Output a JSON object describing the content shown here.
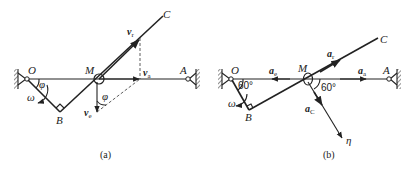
{
  "figure": {
    "panel_a": {
      "caption": "(a)",
      "points": {
        "O": "O",
        "M": "M",
        "A": "A",
        "B": "B",
        "C": "C"
      },
      "vectors": {
        "v_r": {
          "base": "v",
          "sub": "r"
        },
        "v_a": {
          "base": "v",
          "sub": "a"
        },
        "v_e": {
          "base": "v",
          "sub": "e"
        }
      },
      "angles": {
        "phi_O": "φ",
        "phi_M": "φ"
      },
      "omega": "ω"
    },
    "panel_b": {
      "caption": "(b)",
      "points": {
        "O": "O",
        "M": "M",
        "A": "A",
        "B": "B",
        "C": "C"
      },
      "vectors": {
        "a_r": {
          "base": "a",
          "sub": "r"
        },
        "a_e": {
          "base": "a",
          "sub": "e"
        },
        "a_a": {
          "base": "a",
          "sub": "a"
        },
        "a_C": {
          "base": "a",
          "sub": "C"
        }
      },
      "angles": {
        "angle_O": "60°",
        "angle_M": "60°"
      },
      "omega": "ω",
      "axis": "η"
    }
  }
}
